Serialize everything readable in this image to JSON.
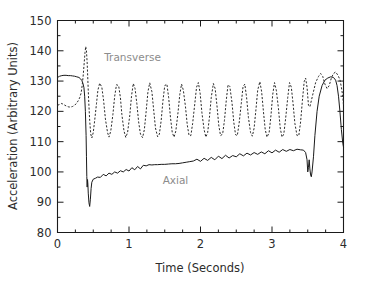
{
  "chart_data": {
    "type": "line",
    "title": "",
    "xlabel": "Time (Seconds)",
    "ylabel": "Acceleration (Arbitrary Units)",
    "xlim": [
      0,
      4
    ],
    "ylim": [
      80,
      150
    ],
    "xticks": [
      0,
      1,
      2,
      3,
      4
    ],
    "xtick_labels": [
      "0",
      "1",
      "2",
      "3",
      "4"
    ],
    "yticks": [
      80,
      90,
      100,
      110,
      120,
      130,
      140,
      150
    ],
    "ytick_labels": [
      "80",
      "90",
      "100",
      "110",
      "120",
      "130",
      "140",
      "150"
    ],
    "x_minor_interval": 0.25,
    "y_minor_interval": 5,
    "grid": false,
    "legend": "inline annotations",
    "annotations": [
      {
        "text": "Transverse",
        "x": 1.05,
        "y": 136.5,
        "color": "#8c8c8c"
      },
      {
        "text": "Axial",
        "x": 1.65,
        "y": 96.0,
        "color": "#8c8c8c"
      }
    ],
    "series": [
      {
        "name": "Axial",
        "style": "solid",
        "color": "#1a1a1a",
        "x": [
          0.0,
          0.03,
          0.06,
          0.09,
          0.12,
          0.15,
          0.18,
          0.21,
          0.24,
          0.27,
          0.3,
          0.32,
          0.34,
          0.355,
          0.37,
          0.38,
          0.39,
          0.4,
          0.405,
          0.41,
          0.415,
          0.42,
          0.425,
          0.43,
          0.44,
          0.45,
          0.46,
          0.47,
          0.48,
          0.5,
          0.53,
          0.56,
          0.6,
          0.64,
          0.68,
          0.72,
          0.76,
          0.8,
          0.84,
          0.88,
          0.92,
          0.96,
          1.0,
          1.04,
          1.08,
          1.12,
          1.16,
          1.2,
          1.24,
          1.28,
          1.32,
          1.36,
          1.4,
          1.45,
          1.5,
          1.55,
          1.6,
          1.65,
          1.7,
          1.75,
          1.8,
          1.85,
          1.9,
          1.95,
          2.0,
          2.05,
          2.1,
          2.15,
          2.2,
          2.25,
          2.3,
          2.35,
          2.4,
          2.45,
          2.5,
          2.55,
          2.6,
          2.65,
          2.7,
          2.75,
          2.8,
          2.85,
          2.9,
          2.95,
          3.0,
          3.05,
          3.1,
          3.15,
          3.2,
          3.25,
          3.3,
          3.35,
          3.4,
          3.44,
          3.47,
          3.49,
          3.5,
          3.51,
          3.52,
          3.53,
          3.54,
          3.55,
          3.56,
          3.58,
          3.6,
          3.63,
          3.66,
          3.7,
          3.74,
          3.78,
          3.82,
          3.86,
          3.89,
          3.91,
          3.93,
          3.95,
          3.97,
          3.99,
          4.0
        ],
        "y": [
          131.2,
          131.6,
          131.8,
          131.9,
          131.9,
          131.8,
          131.8,
          131.7,
          131.6,
          131.4,
          131.2,
          130.8,
          130.2,
          129.3,
          127.8,
          125.0,
          120.0,
          112.0,
          105.0,
          98.5,
          95.0,
          97.5,
          96.0,
          93.0,
          89.8,
          88.6,
          91.0,
          94.5,
          96.6,
          97.6,
          97.9,
          98.3,
          98.2,
          99.2,
          98.7,
          99.6,
          99.2,
          100.0,
          99.6,
          100.4,
          100.0,
          100.8,
          100.3,
          101.4,
          100.7,
          101.8,
          101.0,
          102.2,
          102.0,
          102.4,
          102.3,
          102.4,
          102.4,
          102.5,
          102.5,
          102.6,
          102.7,
          102.7,
          102.8,
          103.0,
          103.2,
          103.4,
          103.6,
          104.2,
          103.5,
          104.5,
          103.8,
          104.8,
          104.0,
          105.2,
          104.4,
          105.5,
          104.6,
          105.4,
          105.0,
          106.0,
          105.3,
          106.2,
          105.6,
          106.4,
          105.8,
          106.6,
          106.0,
          107.0,
          106.3,
          107.2,
          106.5,
          107.4,
          106.8,
          107.4,
          107.0,
          107.5,
          107.3,
          107.2,
          106.4,
          104.0,
          100.0,
          101.5,
          104.0,
          101.0,
          99.0,
          98.4,
          100.0,
          105.0,
          112.0,
          120.0,
          125.0,
          128.5,
          130.3,
          131.0,
          131.4,
          131.2,
          130.3,
          128.5,
          125.0,
          120.0,
          114.0,
          109.5,
          108.2
        ]
      },
      {
        "name": "Transverse",
        "style": "dashed",
        "color": "#2b2b2b",
        "x": [
          0.0,
          0.03,
          0.06,
          0.09,
          0.12,
          0.15,
          0.18,
          0.21,
          0.24,
          0.27,
          0.29,
          0.31,
          0.33,
          0.345,
          0.36,
          0.375,
          0.385,
          0.395,
          0.405,
          0.415,
          0.425,
          0.435,
          0.45,
          0.465,
          0.48,
          0.5,
          0.52,
          0.545,
          0.565,
          0.59,
          0.62,
          0.645,
          0.67,
          0.7,
          0.72,
          0.745,
          0.775,
          0.8,
          0.825,
          0.855,
          0.88,
          0.9,
          0.93,
          0.955,
          0.98,
          1.01,
          1.035,
          1.06,
          1.085,
          1.11,
          1.135,
          1.16,
          1.19,
          1.215,
          1.24,
          1.265,
          1.29,
          1.32,
          1.345,
          1.37,
          1.4,
          1.425,
          1.45,
          1.475,
          1.5,
          1.53,
          1.555,
          1.58,
          1.605,
          1.63,
          1.655,
          1.685,
          1.71,
          1.735,
          1.76,
          1.79,
          1.815,
          1.84,
          1.865,
          1.89,
          1.92,
          1.945,
          1.97,
          1.995,
          2.02,
          2.05,
          2.075,
          2.1,
          2.125,
          2.15,
          2.18,
          2.205,
          2.23,
          2.255,
          2.28,
          2.31,
          2.335,
          2.36,
          2.385,
          2.41,
          2.44,
          2.465,
          2.49,
          2.515,
          2.54,
          2.57,
          2.595,
          2.62,
          2.645,
          2.67,
          2.7,
          2.725,
          2.75,
          2.775,
          2.8,
          2.83,
          2.855,
          2.88,
          2.905,
          2.93,
          2.96,
          2.985,
          3.01,
          3.035,
          3.06,
          3.09,
          3.115,
          3.14,
          3.165,
          3.19,
          3.22,
          3.245,
          3.27,
          3.295,
          3.32,
          3.35,
          3.375,
          3.4,
          3.425,
          3.45,
          3.47,
          3.49,
          3.51,
          3.53,
          3.55,
          3.58,
          3.61,
          3.65,
          3.68,
          3.71,
          3.74,
          3.77,
          3.8,
          3.83,
          3.86,
          3.89,
          3.92,
          3.95,
          3.97,
          3.99,
          4.0
        ],
        "y": [
          122.0,
          122.3,
          122.6,
          122.2,
          121.8,
          121.5,
          121.4,
          121.6,
          122.0,
          122.8,
          123.5,
          124.5,
          126.0,
          128.5,
          132.0,
          136.5,
          139.5,
          141.4,
          140.0,
          136.0,
          130.0,
          124.0,
          117.0,
          112.5,
          111.2,
          113.0,
          117.0,
          122.5,
          127.0,
          129.3,
          128.0,
          123.5,
          117.5,
          113.0,
          111.5,
          113.5,
          119.0,
          125.0,
          128.8,
          128.5,
          124.5,
          119.0,
          113.5,
          111.4,
          113.0,
          118.5,
          125.0,
          129.2,
          127.5,
          122.5,
          116.5,
          112.5,
          111.3,
          114.0,
          120.0,
          126.5,
          129.4,
          126.5,
          120.5,
          114.5,
          111.6,
          112.5,
          117.0,
          123.5,
          128.5,
          129.0,
          124.5,
          118.0,
          113.0,
          111.5,
          113.5,
          119.5,
          125.5,
          129.0,
          127.0,
          121.5,
          115.5,
          112.0,
          112.0,
          116.0,
          122.5,
          128.0,
          129.5,
          126.0,
          119.5,
          114.0,
          111.5,
          113.0,
          118.0,
          124.5,
          129.2,
          127.5,
          122.0,
          115.5,
          112.0,
          112.5,
          117.0,
          123.5,
          128.8,
          128.2,
          123.0,
          116.5,
          112.3,
          112.0,
          116.0,
          122.5,
          128.2,
          129.0,
          124.5,
          118.0,
          113.0,
          111.8,
          114.5,
          120.5,
          127.0,
          129.8,
          126.5,
          120.0,
          114.0,
          111.5,
          113.0,
          118.5,
          125.5,
          129.5,
          127.0,
          121.0,
          114.5,
          111.5,
          112.5,
          117.5,
          124.5,
          129.5,
          128.0,
          122.5,
          116.0,
          112.0,
          112.0,
          116.5,
          123.5,
          129.8,
          131.0,
          128.0,
          122.0,
          121.5,
          123.5,
          126.5,
          129.5,
          131.5,
          132.5,
          131.5,
          129.0,
          127.5,
          128.5,
          131.0,
          132.5,
          133.0,
          132.0,
          130.5,
          128.0,
          125.0,
          122.0
        ]
      }
    ]
  },
  "axis": {
    "x_title": "Time (Seconds)",
    "y_title": "Acceleration (Arbitrary Units)"
  }
}
